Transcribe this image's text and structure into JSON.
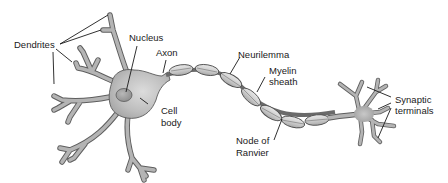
{
  "diagram": {
    "colors": {
      "background": "#ffffff",
      "cell_fill_light": "#d6d6d6",
      "cell_fill_dark": "#a8a8a8",
      "outline": "#5a5a5a",
      "myelin_fill": "#cfcfcf",
      "label_text": "#1a1a1a"
    },
    "labels": {
      "dendrites": "Dendrites",
      "nucleus": "Nucleus",
      "axon": "Axon",
      "cell_body_line1": "Cell",
      "cell_body_line2": "body",
      "neurilemma": "Neurilemma",
      "myelin_sheath_line1": "Myelin",
      "myelin_sheath_line2": "sheath",
      "node_of_ranvier_line1": "Node of",
      "node_of_ranvier_line2": "Ranvier",
      "synaptic_terminals_line1": "Synaptic",
      "synaptic_terminals_line2": "terminals"
    },
    "parts": [
      {
        "name": "Dendrites",
        "leader_count": 4
      },
      {
        "name": "Nucleus",
        "leader_count": 1
      },
      {
        "name": "Axon",
        "leader_count": 1
      },
      {
        "name": "Cell body",
        "leader_count": 1
      },
      {
        "name": "Neurilemma",
        "leader_count": 1
      },
      {
        "name": "Myelin sheath",
        "leader_count": 1
      },
      {
        "name": "Node of Ranvier",
        "leader_count": 1
      },
      {
        "name": "Synaptic terminals",
        "leader_count": 3
      }
    ],
    "myelin_segment_count": 8
  }
}
